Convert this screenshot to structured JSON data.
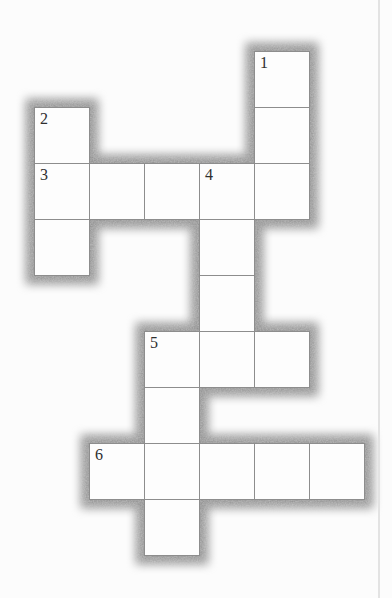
{
  "page": {
    "background": "#fcfcfc",
    "edge_line_color": "#e3e3e3",
    "edge_line_x": 378
  },
  "colors": {
    "cell_background": "#fdfdfd",
    "cell_border": "#8d8d8d",
    "number_color": "#2f2f2f",
    "shadow_color": "#8a8a8a"
  },
  "puzzle": {
    "type": "crossword-grid",
    "visible_numbers": [
      "1",
      "2",
      "3",
      "4",
      "5",
      "6"
    ],
    "grid": {
      "origin_x": 34,
      "origin_y": 51,
      "cell_width": 55,
      "cell_height": 56,
      "columns": 6,
      "rows": 9
    },
    "shadow": {
      "spread": 8,
      "blur": 5
    },
    "cells": [
      {
        "col": 4,
        "row": 0,
        "number": "1"
      },
      {
        "col": 4,
        "row": 1
      },
      {
        "col": 0,
        "row": 1,
        "number": "2"
      },
      {
        "col": 0,
        "row": 2,
        "number": "3"
      },
      {
        "col": 1,
        "row": 2
      },
      {
        "col": 2,
        "row": 2
      },
      {
        "col": 3,
        "row": 2,
        "number": "4"
      },
      {
        "col": 4,
        "row": 2
      },
      {
        "col": 0,
        "row": 3
      },
      {
        "col": 3,
        "row": 3
      },
      {
        "col": 3,
        "row": 4
      },
      {
        "col": 2,
        "row": 5,
        "number": "5"
      },
      {
        "col": 3,
        "row": 5
      },
      {
        "col": 4,
        "row": 5
      },
      {
        "col": 2,
        "row": 6
      },
      {
        "col": 1,
        "row": 7,
        "number": "6"
      },
      {
        "col": 2,
        "row": 7
      },
      {
        "col": 3,
        "row": 7
      },
      {
        "col": 4,
        "row": 7
      },
      {
        "col": 5,
        "row": 7
      },
      {
        "col": 2,
        "row": 8
      }
    ],
    "entries": [
      {
        "number": "1",
        "direction": "down",
        "length": 3
      },
      {
        "number": "2",
        "direction": "down",
        "length": 3
      },
      {
        "number": "3",
        "direction": "across",
        "length": 5
      },
      {
        "number": "4",
        "direction": "down",
        "length": 4
      },
      {
        "number": "5",
        "direction": "across",
        "length": 3
      },
      {
        "number": "5",
        "direction": "down",
        "length": 4
      },
      {
        "number": "6",
        "direction": "across",
        "length": 5
      }
    ]
  }
}
